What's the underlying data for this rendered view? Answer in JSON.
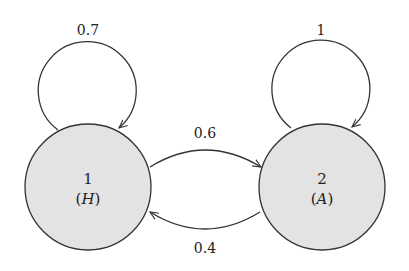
{
  "diagram": {
    "type": "markov-chain",
    "colors": {
      "node_fill": "#e3e3e3",
      "stroke": "#333333",
      "background": "#ffffff"
    },
    "states": [
      {
        "id": "1",
        "number": "1",
        "label": "(H)",
        "label_open": "(",
        "label_var": "H",
        "label_close": ")"
      },
      {
        "id": "2",
        "number": "2",
        "label": "(A)",
        "label_open": "(",
        "label_var": "A",
        "label_close": ")"
      }
    ],
    "transitions": [
      {
        "from": "1",
        "to": "1",
        "prob": "0.7"
      },
      {
        "from": "1",
        "to": "2",
        "prob": "0.6"
      },
      {
        "from": "2",
        "to": "1",
        "prob": "0.4"
      },
      {
        "from": "2",
        "to": "2",
        "prob": "1"
      }
    ]
  }
}
